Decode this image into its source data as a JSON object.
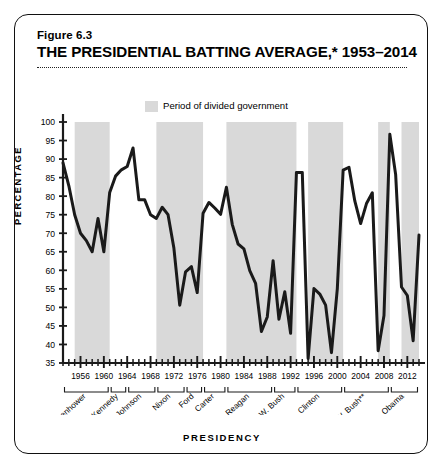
{
  "figure": {
    "number": "Figure 6.3",
    "title": "THE PRESIDENTIAL BATTING AVERAGE,* 1953–2014"
  },
  "legend": {
    "swatch_color": "#d9d9d9",
    "label": "Period of divided government"
  },
  "chart_data": {
    "type": "line",
    "title": "THE PRESIDENTIAL BATTING AVERAGE,* 1953–2014",
    "xlabel": "PRESIDENCY",
    "ylabel": "PERCENTAGE",
    "ylim": [
      35,
      100
    ],
    "xlim": [
      1953,
      2014
    ],
    "ytick_step": 5,
    "yticks": [
      35,
      40,
      45,
      50,
      55,
      60,
      65,
      70,
      75,
      80,
      85,
      90,
      95,
      100
    ],
    "xticks": [
      1956,
      1960,
      1964,
      1968,
      1972,
      1976,
      1980,
      1984,
      1988,
      1992,
      1996,
      2000,
      2004,
      2008,
      2012
    ],
    "xtick_minor_step": 1,
    "grid": false,
    "legend_position": "top-center",
    "line_color": "#1a1a1a",
    "line_width": 3.0,
    "series_name": "Presidential success rate on congressional votes",
    "x": [
      1953,
      1954,
      1955,
      1956,
      1957,
      1958,
      1959,
      1960,
      1961,
      1962,
      1963,
      1964,
      1965,
      1966,
      1967,
      1968,
      1969,
      1970,
      1971,
      1972,
      1973,
      1974,
      1975,
      1976,
      1977,
      1978,
      1979,
      1980,
      1981,
      1982,
      1983,
      1984,
      1985,
      1986,
      1987,
      1988,
      1989,
      1990,
      1991,
      1992,
      1993,
      1994,
      1995,
      1996,
      1997,
      1998,
      1999,
      2000,
      2001,
      2002,
      2003,
      2004,
      2005,
      2006,
      2007,
      2008,
      2009,
      2010,
      2011,
      2012,
      2013,
      2014
    ],
    "y": [
      89.0,
      82.8,
      75.0,
      70.0,
      68.0,
      65.0,
      74.0,
      65.0,
      81.0,
      85.4,
      87.1,
      88.0,
      93.0,
      79.0,
      79.0,
      75.0,
      74.0,
      77.0,
      75.0,
      66.0,
      50.6,
      59.6,
      61.0,
      54.0,
      75.4,
      78.3,
      76.8,
      75.1,
      82.4,
      72.4,
      67.1,
      65.8,
      59.9,
      56.5,
      43.5,
      47.4,
      62.6,
      46.8,
      54.2,
      43.0,
      86.4,
      86.4,
      36.2,
      55.1,
      53.6,
      50.6,
      37.8,
      55.0,
      87.0,
      87.8,
      78.7,
      72.6,
      78.0,
      80.9,
      38.3,
      47.8,
      96.7,
      85.8,
      55.5,
      53.2,
      41.0,
      69.5
    ],
    "divided_government_periods": [
      {
        "start": 1955,
        "end": 1961
      },
      {
        "start": 1969,
        "end": 1977
      },
      {
        "start": 1981,
        "end": 1993
      },
      {
        "start": 1995,
        "end": 2001
      },
      {
        "start": 2007,
        "end": 2009
      },
      {
        "start": 2011,
        "end": 2014
      }
    ],
    "presidents": [
      {
        "name": "Eisenhower",
        "start": 1953,
        "end": 1961
      },
      {
        "name": "Kennedy",
        "start": 1961,
        "end": 1964
      },
      {
        "name": "Johnson",
        "start": 1964,
        "end": 1969
      },
      {
        "name": "Nixon",
        "start": 1969,
        "end": 1974
      },
      {
        "name": "Ford",
        "start": 1974,
        "end": 1977
      },
      {
        "name": "Carter",
        "start": 1977,
        "end": 1981
      },
      {
        "name": "Reagan",
        "start": 1981,
        "end": 1989
      },
      {
        "name": "G. H. W. Bush",
        "start": 1989,
        "end": 1993
      },
      {
        "name": "Clinton",
        "start": 1993,
        "end": 2001
      },
      {
        "name": "G. W. Bush**",
        "start": 2001,
        "end": 2009
      },
      {
        "name": "Obama",
        "start": 2009,
        "end": 2014
      }
    ]
  }
}
